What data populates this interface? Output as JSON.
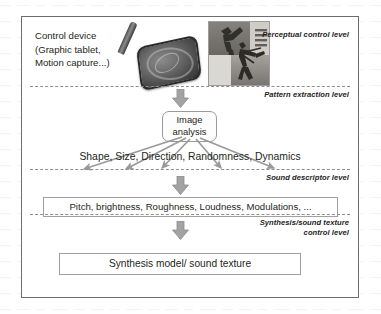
{
  "diagram": {
    "colors": {
      "frame_border": "#6d6d6d",
      "separator": "#8f8f8f",
      "arrow_fill": "#9e9e9e",
      "arrow_stroke": "#808080",
      "box_border": "#a0a0a0",
      "text": "#231f20"
    },
    "control_device": {
      "caption": "Control device\n(Graphic tablet,\nMotion capture...)",
      "tablet_icon": "graphic-tablet-icon",
      "stylus_icon": "stylus-icon"
    },
    "photo": {
      "alt": "Grayscale collage of a martial arts kick and a dancer figure"
    },
    "levels": [
      {
        "id": "perceptual",
        "label": "Perceptual control level"
      },
      {
        "id": "pattern-extraction",
        "label": "Pattern extraction level"
      },
      {
        "id": "sound-descriptor",
        "label": "Sound descriptor level"
      },
      {
        "id": "synthesis-control",
        "label": "Synthesis/sound texture\ncontrol level"
      }
    ],
    "nodes": {
      "image_analysis": "Image\nanalysis",
      "image_features": "Shape, Size, Direction, Randomness, Dynamics",
      "sound_descriptors": "Pitch, brightness, Roughness, Loudness, Modulations, ...",
      "synthesis_model": "Synthesis model/ sound texture"
    },
    "flow_arrows": {
      "to_image_analysis": "down-arrow-icon",
      "to_sound_descriptors": "down-arrow-icon",
      "to_synthesis_model": "down-arrow-icon",
      "fan_out": "fan-arrows-icon",
      "fan_out_count": 5
    }
  }
}
